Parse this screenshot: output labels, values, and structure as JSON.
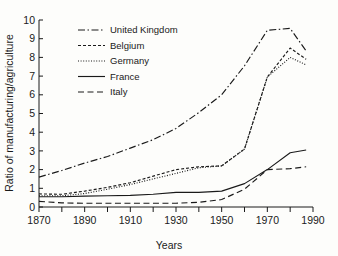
{
  "chart_data": {
    "type": "line",
    "title": "",
    "xlabel": "Years",
    "ylabel": "Ratio of manufacturing/agriculture",
    "xlim": [
      1870,
      1990
    ],
    "ylim": [
      0,
      10
    ],
    "xticks": [
      1870,
      1890,
      1910,
      1930,
      1950,
      1970,
      1990
    ],
    "xticklabels": [
      "1870",
      "1890",
      "1910",
      "1930",
      "1950",
      "1970",
      "1990"
    ],
    "xminorticks": [
      1880,
      1900,
      1920,
      1940,
      1960,
      1980
    ],
    "yticks": [
      0,
      1,
      2,
      3,
      4,
      5,
      6,
      7,
      8,
      9,
      10
    ],
    "yticklabels": [
      "0",
      "1",
      "2",
      "3",
      "4",
      "5",
      "6",
      "7",
      "8",
      "9",
      "10"
    ],
    "grid": false,
    "legend_position": "upper-left",
    "series": [
      {
        "name": "United Kingdom",
        "linestyle": "dashdot",
        "dasharray": "7,2.5,1.5,2.5",
        "x": [
          1870,
          1880,
          1890,
          1900,
          1910,
          1920,
          1930,
          1940,
          1950,
          1960,
          1970,
          1980,
          1987
        ],
        "values": [
          1.6,
          1.95,
          2.35,
          2.7,
          3.15,
          3.6,
          4.2,
          5.05,
          6.0,
          7.55,
          9.45,
          9.55,
          8.35
        ]
      },
      {
        "name": "Belgium",
        "linestyle": "dashed-short",
        "dasharray": "3,2",
        "x": [
          1870,
          1880,
          1890,
          1900,
          1910,
          1920,
          1930,
          1940,
          1950,
          1960,
          1970,
          1980,
          1987
        ],
        "values": [
          0.7,
          0.68,
          0.85,
          1.05,
          1.3,
          1.65,
          2.0,
          2.15,
          2.2,
          3.1,
          6.95,
          8.5,
          7.9
        ]
      },
      {
        "name": "Germany",
        "linestyle": "dotted",
        "dasharray": "1,1.6",
        "x": [
          1870,
          1880,
          1890,
          1900,
          1910,
          1920,
          1930,
          1940,
          1950,
          1960,
          1970,
          1980,
          1987
        ],
        "values": [
          0.6,
          0.6,
          0.72,
          0.95,
          1.2,
          1.5,
          1.8,
          2.1,
          2.2,
          3.1,
          6.95,
          8.0,
          7.6
        ]
      },
      {
        "name": "France",
        "linestyle": "solid",
        "dasharray": "",
        "x": [
          1870,
          1880,
          1890,
          1900,
          1910,
          1920,
          1930,
          1940,
          1950,
          1960,
          1970,
          1980,
          1987
        ],
        "values": [
          0.55,
          0.55,
          0.58,
          0.6,
          0.62,
          0.68,
          0.78,
          0.78,
          0.85,
          1.25,
          2.0,
          2.9,
          3.05
        ]
      },
      {
        "name": "Italy",
        "linestyle": "dashed-long",
        "dasharray": "6,3.5",
        "x": [
          1870,
          1880,
          1890,
          1900,
          1910,
          1920,
          1930,
          1940,
          1950,
          1960,
          1970,
          1980,
          1987
        ],
        "values": [
          0.3,
          0.22,
          0.2,
          0.2,
          0.2,
          0.2,
          0.2,
          0.25,
          0.4,
          0.95,
          2.0,
          2.05,
          2.15
        ]
      }
    ]
  }
}
